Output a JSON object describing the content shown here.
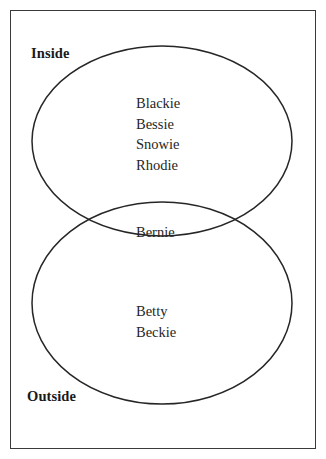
{
  "diagram": {
    "type": "venn",
    "title": "",
    "frame": {
      "border_color": "#3a3a3a",
      "background_color": "#ffffff"
    },
    "stroke_color": "#262626",
    "regions": [
      {
        "name": "inside",
        "label": "Inside",
        "members": [
          "Blackie",
          "Bessie",
          "Snowie",
          "Rhodie"
        ]
      },
      {
        "name": "intersection",
        "label": "",
        "members": [
          "Bernie"
        ]
      },
      {
        "name": "outside",
        "label": "Outside",
        "members": [
          "Betty",
          "Beckie"
        ]
      }
    ],
    "labels": {
      "inside": "Inside",
      "outside": "Outside"
    },
    "members": {
      "inside_only": [
        "Blackie",
        "Bessie",
        "Snowie",
        "Rhodie"
      ],
      "both": [
        "Bernie"
      ],
      "outside_only": [
        "Betty",
        "Beckie"
      ]
    },
    "ellipses": [
      {
        "name": "inside-ellipse",
        "cx": 162,
        "cy": 141,
        "rx": 130,
        "ry": 95
      },
      {
        "name": "outside-ellipse",
        "cx": 162,
        "cy": 303,
        "rx": 130,
        "ry": 101
      }
    ]
  }
}
